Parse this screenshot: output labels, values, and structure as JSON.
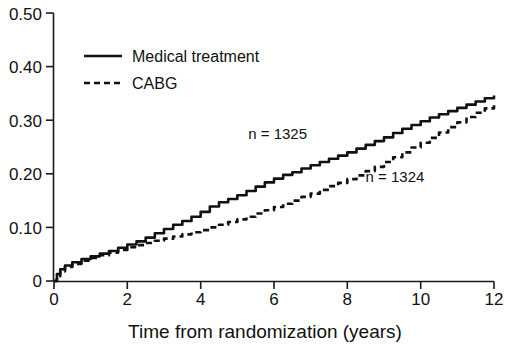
{
  "chart_data": {
    "type": "line",
    "title": "",
    "subtitle": "",
    "xlabel": "Time from randomization (years)",
    "ylabel": "",
    "xlim": [
      0,
      12
    ],
    "ylim": [
      0,
      0.5
    ],
    "grid": false,
    "legend_position": "top-left",
    "x_ticks": [
      "0",
      "2",
      "4",
      "6",
      "8",
      "10",
      "12"
    ],
    "x_tick_values": [
      0,
      2,
      4,
      6,
      8,
      10,
      12
    ],
    "y_ticks": [
      "0",
      "0.10",
      "0.20",
      "0.30",
      "0.40",
      "0.50"
    ],
    "y_tick_values": [
      0,
      0.1,
      0.2,
      0.3,
      0.4,
      0.5
    ],
    "series": [
      {
        "name": "Medical treatment",
        "style": "solid",
        "annotation": "n = 1325",
        "x": [
          0,
          0.08,
          0.17,
          0.3,
          0.5,
          0.75,
          1.0,
          1.25,
          1.5,
          1.75,
          2.0,
          2.25,
          2.5,
          2.75,
          3.0,
          3.25,
          3.5,
          3.75,
          4.0,
          4.25,
          4.5,
          4.75,
          5.0,
          5.25,
          5.5,
          5.75,
          6.0,
          6.25,
          6.5,
          6.75,
          7.0,
          7.25,
          7.5,
          7.75,
          8.0,
          8.25,
          8.5,
          8.75,
          9.0,
          9.25,
          9.5,
          9.75,
          10.0,
          10.25,
          10.5,
          10.75,
          11.0,
          11.25,
          11.5,
          11.75,
          12.0
        ],
        "y": [
          0.0,
          0.013,
          0.022,
          0.029,
          0.035,
          0.041,
          0.046,
          0.051,
          0.056,
          0.062,
          0.068,
          0.074,
          0.081,
          0.089,
          0.097,
          0.105,
          0.112,
          0.12,
          0.129,
          0.139,
          0.147,
          0.153,
          0.16,
          0.168,
          0.176,
          0.184,
          0.191,
          0.198,
          0.203,
          0.21,
          0.216,
          0.222,
          0.228,
          0.234,
          0.24,
          0.247,
          0.254,
          0.261,
          0.268,
          0.276,
          0.284,
          0.291,
          0.298,
          0.305,
          0.311,
          0.317,
          0.323,
          0.329,
          0.335,
          0.341,
          0.346
        ]
      },
      {
        "name": "CABG",
        "style": "dashed",
        "annotation": "n = 1324",
        "x": [
          0,
          0.08,
          0.17,
          0.3,
          0.5,
          0.75,
          1.0,
          1.25,
          1.5,
          1.75,
          2.0,
          2.25,
          2.5,
          2.75,
          3.0,
          3.25,
          3.5,
          3.75,
          4.0,
          4.25,
          4.5,
          4.75,
          5.0,
          5.25,
          5.5,
          5.75,
          6.0,
          6.25,
          6.5,
          6.75,
          7.0,
          7.25,
          7.5,
          7.75,
          8.0,
          8.25,
          8.5,
          8.75,
          9.0,
          9.25,
          9.5,
          9.75,
          10.0,
          10.25,
          10.5,
          10.75,
          11.0,
          11.25,
          11.5,
          11.75,
          12.0
        ],
        "y": [
          0.0,
          0.009,
          0.018,
          0.026,
          0.032,
          0.038,
          0.043,
          0.048,
          0.053,
          0.058,
          0.063,
          0.067,
          0.071,
          0.075,
          0.079,
          0.083,
          0.087,
          0.091,
          0.095,
          0.1,
          0.105,
          0.11,
          0.115,
          0.12,
          0.126,
          0.132,
          0.138,
          0.144,
          0.15,
          0.157,
          0.163,
          0.17,
          0.177,
          0.183,
          0.19,
          0.197,
          0.205,
          0.213,
          0.222,
          0.231,
          0.24,
          0.249,
          0.258,
          0.267,
          0.277,
          0.287,
          0.296,
          0.306,
          0.314,
          0.322,
          0.328
        ]
      }
    ],
    "annotations": [
      {
        "text": "n = 1325",
        "x": 6.1,
        "y": 0.265
      },
      {
        "text": "n = 1324",
        "x": 9.3,
        "y": 0.185
      }
    ],
    "colors": {
      "line": "#111111",
      "background": "#ffffff",
      "axis": "#1a1a1a"
    }
  },
  "legend": {
    "items": [
      {
        "label": "Medical treatment",
        "style": "solid"
      },
      {
        "label": "CABG",
        "style": "dashed"
      }
    ]
  },
  "axes": {
    "x_title": "Time from randomization (years)",
    "y_tick_0": "0",
    "y_tick_1": "0.10",
    "y_tick_2": "0.20",
    "y_tick_3": "0.30",
    "y_tick_4": "0.40",
    "y_tick_5": "0.50",
    "x_tick_0": "0",
    "x_tick_1": "2",
    "x_tick_2": "4",
    "x_tick_3": "6",
    "x_tick_4": "8",
    "x_tick_5": "10",
    "x_tick_6": "12"
  },
  "annotations": {
    "medical_n": "n = 1325",
    "cabg_n": "n = 1324"
  }
}
